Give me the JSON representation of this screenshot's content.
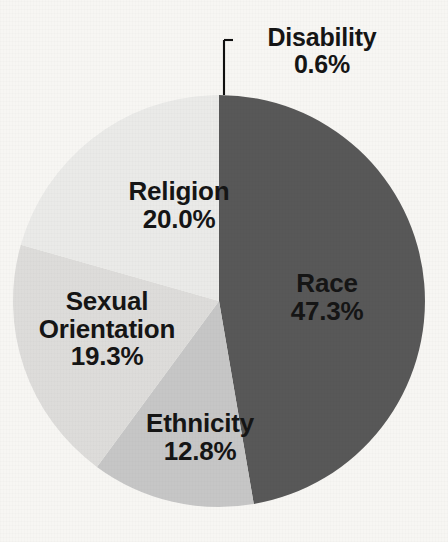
{
  "chart_data": {
    "type": "pie",
    "title": "",
    "subtitle": "",
    "xlabel": "",
    "ylabel": "",
    "legend_position": "none",
    "labels_on_slices": true,
    "value_format": "percent_one_decimal",
    "total_percent": "100.0%",
    "categories": [
      "Race",
      "Ethnicity",
      "Sexual Orientation",
      "Religion",
      "Disability"
    ],
    "values": [
      47.3,
      12.8,
      19.3,
      20.0,
      0.6
    ],
    "slices": [
      {
        "name": "Race",
        "value": 47.3,
        "value_label": "47.3%",
        "color": "#595959",
        "start_angle_deg": 0.0,
        "end_angle_deg": 170.28,
        "label_lines": [
          "Race",
          "47.3%"
        ],
        "label_placement": "inside"
      },
      {
        "name": "Ethnicity",
        "value": 12.8,
        "value_label": "12.8%",
        "color": "#c6c6c6",
        "start_angle_deg": 170.28,
        "end_angle_deg": 216.36,
        "label_lines": [
          "Ethnicity",
          "12.8%"
        ],
        "label_placement": "inside"
      },
      {
        "name": "Sexual Orientation",
        "value": 19.3,
        "value_label": "19.3%",
        "color": "#dddcda",
        "start_angle_deg": 216.36,
        "end_angle_deg": 285.84,
        "label_lines": [
          "Sexual",
          "Orientation",
          "19.3%"
        ],
        "label_placement": "inside"
      },
      {
        "name": "Religion",
        "value": 20.0,
        "value_label": "20.0%",
        "color": "#eaeae8",
        "start_angle_deg": 285.84,
        "end_angle_deg": 357.84,
        "label_lines": [
          "Religion",
          "20.0%"
        ],
        "label_placement": "inside"
      },
      {
        "name": "Disability",
        "value": 0.6,
        "value_label": "0.6%",
        "color": "#eaeae8",
        "start_angle_deg": 357.84,
        "end_angle_deg": 360.0,
        "label_lines": [
          "Disability",
          "0.6%"
        ],
        "label_placement": "outside-leader-line"
      }
    ],
    "geometry": {
      "center_x": 219,
      "center_y": 301,
      "radius": 206
    },
    "background_color": "#f7f6f3",
    "text_color": "#151515"
  },
  "labels": {
    "race": {
      "name": "Race",
      "value": "47.3%"
    },
    "ethnicity": {
      "name": "Ethnicity",
      "value": "12.8%"
    },
    "sexorient": {
      "name_line1": "Sexual",
      "name_line2": "Orientation",
      "value": "19.3%"
    },
    "religion": {
      "name": "Religion",
      "value": "20.0%"
    },
    "disability": {
      "name": "Disability",
      "value": "0.6%"
    }
  }
}
